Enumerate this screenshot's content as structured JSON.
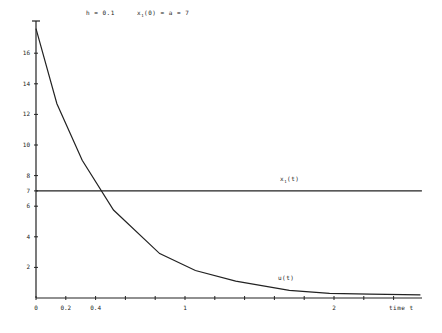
{
  "chart_data": {
    "type": "line",
    "title": "",
    "annotations": {
      "step": "h = 0.1",
      "initial": "x1(0) = a = 7"
    },
    "xlabel": "time t",
    "ylabel": "",
    "xlim": [
      0,
      2.6
    ],
    "ylim": [
      0,
      18
    ],
    "grid": false,
    "legend": "inline labels",
    "x_ticks": [
      0,
      0.2,
      0.4,
      0.6,
      0.8,
      1,
      1.2,
      1.4,
      1.6,
      1.8,
      2,
      2.2,
      2.4
    ],
    "x_tick_labels": [
      "0",
      "0.2",
      "0.4",
      "",
      "",
      "1",
      "",
      "",
      "",
      "",
      "2",
      "",
      ""
    ],
    "y_ticks": [
      2,
      4,
      6,
      7,
      8,
      10,
      12,
      14,
      16
    ],
    "y_tick_labels": [
      "2",
      "4",
      "6",
      "7",
      "8",
      "10",
      "12",
      "14",
      "16"
    ],
    "series": [
      {
        "name": "x1(t)",
        "x": [
          0,
          2.59
        ],
        "values": [
          7,
          7
        ]
      },
      {
        "name": "u(t)",
        "x": [
          0,
          0.14,
          0.31,
          0.52,
          0.83,
          1.07,
          1.34,
          1.7,
          1.97,
          2.24,
          2.58
        ],
        "values": [
          17.6,
          12.7,
          9.0,
          5.75,
          2.9,
          1.8,
          1.1,
          0.5,
          0.3,
          0.25,
          0.2
        ]
      }
    ]
  },
  "labels": {
    "step": "h = 0.1",
    "initial_var": "x",
    "initial_sub": "1",
    "initial_rest": "(0) = a  = 7",
    "x1_var": "x",
    "x1_sub": "1",
    "x1_rest": "(t)",
    "u_label": "u(t)",
    "xlabel": "time t"
  }
}
